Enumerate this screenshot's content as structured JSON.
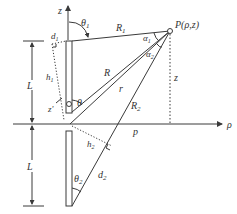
{
  "diagram": {
    "type": "dipole-antenna-geometry",
    "colors": {
      "line": "#3a3a3a",
      "background": "#ffffff"
    },
    "labels": {
      "z_axis": "z",
      "rho_axis": "ρ",
      "theta1": "θ",
      "theta1_sub": "1",
      "R1": "R",
      "R1_sub": "1",
      "point": "P(ρ,z)",
      "alpha1": "α",
      "alpha1_sub": "1",
      "alpha2": "α",
      "alpha2_sub": "2",
      "d1": "d",
      "d1_sub": "1",
      "h1": "h",
      "h1_sub": "1",
      "L_upper": "L",
      "L_lower": "L",
      "R": "R",
      "r": "r",
      "z_prime": "z'",
      "theta": "θ",
      "z_height": "z",
      "R2": "R",
      "R2_sub": "2",
      "p": "p",
      "h2": "h",
      "h2_sub": "2",
      "theta2": "θ",
      "theta2_sub": "2",
      "d2": "d",
      "d2_sub": "2"
    }
  }
}
